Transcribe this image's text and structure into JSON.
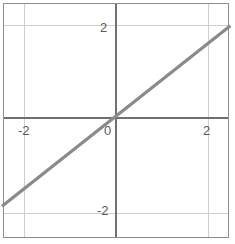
{
  "chart_data": {
    "type": "line",
    "title": "",
    "xlabel": "",
    "ylabel": "",
    "xlim": [
      -2.43,
      2.48
    ],
    "ylim": [
      -2.48,
      2.62
    ],
    "grid": true,
    "legend": null,
    "axes_style": "cartesian-crossed-axes",
    "x_ticks": [
      -2,
      0,
      2
    ],
    "y_ticks": [
      -2,
      2
    ],
    "x_tick_labels": [
      "-2",
      "2"
    ],
    "y_tick_labels": [
      "2",
      "-2"
    ],
    "origin_label": "0",
    "series": [
      {
        "name": "line",
        "equation": "y = 0.79x",
        "slope": 0.79,
        "intercept": 0,
        "color": "#8a8a8a",
        "width": 3,
        "x": [
          -2.43,
          2.48
        ],
        "y": [
          -1.92,
          1.96
        ],
        "points": [
          {
            "x": -2.43,
            "y": -1.92
          },
          {
            "x": -2,
            "y": -1.58
          },
          {
            "x": -1,
            "y": -0.79
          },
          {
            "x": 0,
            "y": 0
          },
          {
            "x": 1,
            "y": 0.79
          },
          {
            "x": 2,
            "y": 1.58
          },
          {
            "x": 2.48,
            "y": 1.96
          }
        ]
      }
    ]
  },
  "geometry": {
    "origin_x_px": 115,
    "origin_y_px": 117,
    "unit_px": 46,
    "grid_x_px": [
      23,
      207
    ],
    "grid_y_px": [
      24,
      212
    ],
    "line_start_px": {
      "x": 3,
      "y": 176
    },
    "line_end_px": {
      "x": 229,
      "y": 2
    }
  },
  "colors": {
    "background": "#ffffff",
    "frame": "#8d8d8d",
    "grid": "#cfcfcf",
    "axis": "#707070",
    "series": "#8a8a8a",
    "tick_text": "#5a5a5a"
  },
  "labels": {
    "x_neg_two": "-2",
    "x_pos_two": "2",
    "y_pos_two": "2",
    "y_neg_two": "-2",
    "origin": "0"
  }
}
